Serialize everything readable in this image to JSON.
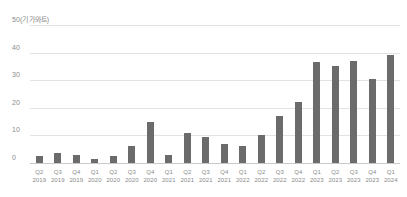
{
  "chart_data": {
    "type": "bar",
    "title": "",
    "subtitle": "",
    "xlabel": "",
    "ylabel": "",
    "unit_label": "50(기가와트)",
    "unit_label_value": 50,
    "ylim": [
      0,
      50
    ],
    "ytick_values": [
      0,
      10,
      20,
      30,
      40,
      50
    ],
    "ytick_labels": [
      "0",
      "10",
      "20",
      "30",
      "40",
      "50(기가와트)"
    ],
    "grid": true,
    "legend": "none",
    "bar_color": "#6b6b6b",
    "grid_color": "#e2e2e2",
    "axis_color": "#c9c9c9",
    "text_color": "#8a8a8a",
    "background": "#ffffff",
    "categories": [
      "Q2 2019",
      "Q3 2019",
      "Q4 2019",
      "Q1 2020",
      "Q2 2020",
      "Q3 2020",
      "Q4 2020",
      "Q1 2021",
      "Q2 2021",
      "Q3 2021",
      "Q4 2021",
      "Q1 2022",
      "Q2 2022",
      "Q3 2022",
      "Q4 2022",
      "Q1 2023",
      "Q2 2023",
      "Q3 2023",
      "Q4 2023",
      "Q1 2024"
    ],
    "quarters": [
      "Q2",
      "Q3",
      "Q4",
      "Q1",
      "Q2",
      "Q3",
      "Q4",
      "Q1",
      "Q2",
      "Q3",
      "Q4",
      "Q1",
      "Q2",
      "Q3",
      "Q4",
      "Q1",
      "Q2",
      "Q3",
      "Q4",
      "Q1"
    ],
    "years": [
      "2019",
      "2019",
      "2019",
      "2020",
      "2020",
      "2020",
      "2020",
      "2021",
      "2021",
      "2021",
      "2021",
      "2022",
      "2022",
      "2022",
      "2022",
      "2023",
      "2023",
      "2023",
      "2023",
      "2024"
    ],
    "values": [
      2.5,
      3.5,
      3.0,
      1.5,
      2.5,
      6.0,
      15.0,
      3.0,
      11.0,
      9.5,
      7.0,
      6.0,
      10.0,
      17.0,
      22.0,
      36.5,
      35.0,
      37.0,
      30.5,
      39.0
    ]
  }
}
